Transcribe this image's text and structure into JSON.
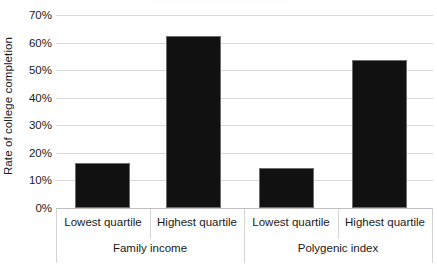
{
  "chart_data": {
    "type": "bar",
    "title": "",
    "xlabel": "",
    "ylabel": "Rate of college completion",
    "ylim": [
      0,
      70
    ],
    "grid": true,
    "legend": "none",
    "ytick_labels": [
      "70%",
      "60%",
      "50%",
      "40%",
      "30%",
      "20%",
      "10%",
      "0%"
    ],
    "ytick_values": [
      70,
      60,
      50,
      40,
      30,
      20,
      10,
      0
    ],
    "groups": [
      {
        "name": "Family income",
        "categories": [
          "Lowest quartile",
          "Highest quartile"
        ],
        "values": [
          16.3,
          62.3
        ]
      },
      {
        "name": "Polygenic index",
        "categories": [
          "Lowest quartile",
          "Highest quartile"
        ],
        "values": [
          14.5,
          53.6
        ]
      }
    ],
    "categories": [
      "Lowest quartile",
      "Highest quartile",
      "Lowest quartile",
      "Highest quartile"
    ],
    "values": [
      16.3,
      62.3,
      14.5,
      53.6
    ],
    "bar_color": "#111111",
    "grid_color": "#d9d9d9",
    "axis_color": "#bfbfbf"
  },
  "axis": {
    "y_title": "Rate of college completion",
    "ticks": [
      {
        "label": "70%",
        "value": 70
      },
      {
        "label": "60%",
        "value": 60
      },
      {
        "label": "50%",
        "value": 50
      },
      {
        "label": "40%",
        "value": 40
      },
      {
        "label": "30%",
        "value": 30
      },
      {
        "label": "20%",
        "value": 20
      },
      {
        "label": "10%",
        "value": 10
      },
      {
        "label": "0%",
        "value": 0
      }
    ]
  },
  "bars": [
    {
      "label": "Lowest quartile",
      "value": 16.3,
      "group": "Family income"
    },
    {
      "label": "Highest quartile",
      "value": 62.3,
      "group": "Family income"
    },
    {
      "label": "Lowest quartile",
      "value": 14.5,
      "group": "Polygenic index"
    },
    {
      "label": "Highest quartile",
      "value": 53.6,
      "group": "Polygenic index"
    }
  ],
  "groups": [
    {
      "label": "Family income"
    },
    {
      "label": "Polygenic index"
    }
  ]
}
